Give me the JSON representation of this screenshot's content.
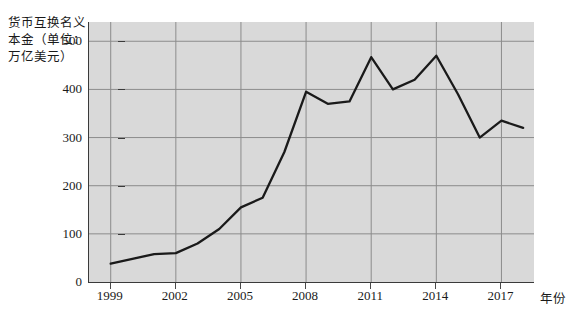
{
  "chart_data": {
    "type": "line",
    "title": "",
    "ylabel": "货币互换名义本金（单位：\n万亿美元）",
    "xlabel": "年份",
    "grid": true,
    "legend": "none",
    "xlim": [
      1998,
      2018.5
    ],
    "ylim": [
      0,
      540
    ],
    "xticks": [
      "1999",
      "2002",
      "2005",
      "2008",
      "2011",
      "2014",
      "2017"
    ],
    "xtick_values": [
      1999,
      2002,
      2005,
      2008,
      2011,
      2014,
      2017
    ],
    "yticks": [
      "0",
      "100",
      "200",
      "300",
      "400",
      "500"
    ],
    "ytick_values": [
      0,
      100,
      200,
      300,
      400,
      500
    ],
    "series": [
      {
        "name": "货币互换名义本金",
        "color": "#1a1a1a",
        "x": [
          1999,
          2000,
          2001,
          2002,
          2003,
          2004,
          2005,
          2006,
          2007,
          2008,
          2009,
          2010,
          2011,
          2012,
          2013,
          2014,
          2015,
          2016,
          2017,
          2018
        ],
        "values": [
          38,
          48,
          58,
          60,
          80,
          110,
          155,
          175,
          270,
          395,
          370,
          375,
          467,
          400,
          420,
          470,
          390,
          300,
          335,
          320
        ]
      }
    ],
    "annotations": []
  },
  "axes": {
    "y_caption": "货币互换名义本金（单位：\n万亿美元）",
    "x_caption": "年份"
  },
  "style": {
    "plot_background": "#d9d9d9",
    "line_color": "#1a1a1a",
    "grid_color": "#8c8c8c",
    "axis_color": "#3a3a3a",
    "page_background": "#ffffff"
  }
}
